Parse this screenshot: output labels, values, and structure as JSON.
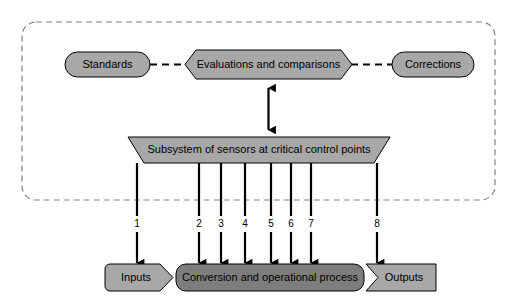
{
  "diagram": {
    "colors": {
      "shape_light": "#a8a8a8",
      "shape_dark": "#8c8c8c",
      "shape_process": "#7d7d7d",
      "outline": "#000000",
      "boundary": "#808080",
      "background": "#ffffff",
      "text": "#000000"
    },
    "boundary": {
      "label": "control-system-boundary",
      "style": "dashed-rounded-rectangle"
    },
    "nodes": [
      {
        "id": "standards",
        "label": "Standards",
        "shape": "stadium",
        "x": 65,
        "y": 52,
        "w": 85,
        "h": 25
      },
      {
        "id": "evaluations",
        "label": "Evaluations and comparisons",
        "shape": "hexagon",
        "x": 185,
        "y": 50,
        "w": 167,
        "h": 29
      },
      {
        "id": "corrections",
        "label": "Corrections",
        "shape": "stadium",
        "x": 392,
        "y": 52,
        "w": 82,
        "h": 25
      },
      {
        "id": "subsystem",
        "label": "Subsystem of sensors at critical control points",
        "shape": "trapezoid",
        "x": 128,
        "y": 137,
        "w": 262,
        "h": 26
      },
      {
        "id": "inputs",
        "label": "Inputs",
        "shape": "pentagon-right",
        "x": 105,
        "y": 264,
        "w": 68,
        "h": 27
      },
      {
        "id": "process",
        "label": "Conversion and operational process",
        "shape": "rounded-rect",
        "x": 176,
        "y": 264,
        "w": 188,
        "h": 27
      },
      {
        "id": "outputs",
        "label": "Outputs",
        "shape": "chevron-right",
        "x": 366,
        "y": 264,
        "w": 70,
        "h": 27
      }
    ],
    "connectors": [
      {
        "id": "standards-to-evaluations",
        "style": "dashed",
        "from": "standards",
        "to": "evaluations"
      },
      {
        "id": "evaluations-to-corrections",
        "style": "dashed",
        "from": "evaluations",
        "to": "corrections"
      },
      {
        "id": "evaluations-subsystem-bidirectional",
        "style": "double-arrow-vertical",
        "from": "evaluations",
        "to": "subsystem"
      }
    ],
    "sensor_arrows": [
      {
        "number": "1",
        "x": 137,
        "target": "inputs"
      },
      {
        "number": "2",
        "x": 199,
        "target": "process"
      },
      {
        "number": "3",
        "x": 221,
        "target": "process"
      },
      {
        "number": "4",
        "x": 245,
        "target": "process"
      },
      {
        "number": "5",
        "x": 271,
        "target": "process"
      },
      {
        "number": "6",
        "x": 291,
        "target": "process"
      },
      {
        "number": "7",
        "x": 311,
        "target": "process"
      },
      {
        "number": "8",
        "x": 377,
        "target": "outputs"
      }
    ]
  }
}
